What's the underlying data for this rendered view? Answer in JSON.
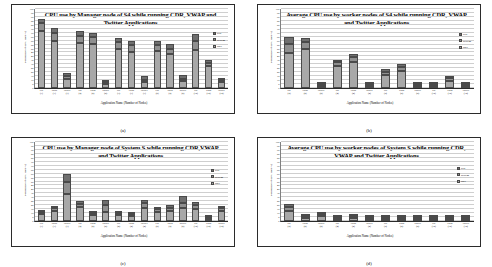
{
  "figure": {
    "panel_letters": [
      "(a)",
      "(b)",
      "(c)",
      "(d)"
    ],
    "axis_titles": {
      "x": "Application Name (Number of Nodes)",
      "y": "Percentage of CPU use (%)"
    },
    "legend": [
      {
        "label": "real",
        "color": "#6f6f6f"
      },
      {
        "label": "system",
        "color": "#8f8f8f"
      },
      {
        "label": "user",
        "color": "#a8a8a8"
      }
    ],
    "yticks": [
      0,
      5,
      10,
      15,
      20,
      25,
      30,
      35,
      40,
      45,
      50,
      55,
      60,
      65,
      70,
      75,
      80,
      85,
      90,
      95,
      100
    ]
  },
  "chart_data": [
    {
      "type": "bar",
      "id": "a",
      "title": "CPU use by Manager node of S4 while running CDR, VWAP and Twitter Applications",
      "xlabel": "Application Name (Number of Nodes)",
      "ylabel": "Percentage of CPU use (%)",
      "ylim": [
        0,
        100
      ],
      "grid": true,
      "legend_position": "right",
      "stacked": true,
      "categories": [
        "cdr (1)",
        "vwap (1)",
        "twitter (1)",
        "cdr (2)",
        "vwap (2)",
        "twitter (2)",
        "cdr (3)",
        "vwap (3)",
        "twitter (3)",
        "cdr (8)",
        "vwap (8)",
        "twitter (8)",
        "cdr (12)",
        "vwap (12)",
        "twitter (12)"
      ],
      "series": [
        {
          "name": "user",
          "values": [
            72,
            60,
            12,
            57,
            56,
            5,
            50,
            46,
            8,
            47,
            43,
            9,
            48,
            28,
            9
          ]
        },
        {
          "name": "system",
          "values": [
            10,
            10,
            3,
            9,
            9,
            2,
            8,
            8,
            2,
            7,
            7,
            2,
            12,
            4,
            2
          ]
        },
        {
          "name": "real",
          "values": [
            5,
            6,
            4,
            6,
            5,
            3,
            5,
            5,
            5,
            6,
            6,
            5,
            9,
            3,
            2
          ]
        }
      ],
      "totals": [
        87,
        76,
        19,
        72,
        70,
        10,
        63,
        59,
        15,
        60,
        56,
        16,
        69,
        35,
        13
      ]
    },
    {
      "type": "bar",
      "id": "b",
      "title": "Average CPU use by worker nodes of S4 while running CDR, VWAP and Twitter Applications",
      "xlabel": "Application Name (Number of Nodes)",
      "ylabel": "Percentage of CPU use (%)",
      "ylim": [
        0,
        100
      ],
      "grid": true,
      "legend_position": "right",
      "stacked": true,
      "categories": [
        "cdr (2)",
        "vwap (2)",
        "twitter (2)",
        "cdr (4)",
        "vwap (4)",
        "twitter (4)",
        "cdr (8)",
        "vwap (8)",
        "twitter (8)",
        "cdr (12)",
        "vwap (12)",
        "twitter (12)"
      ],
      "series": [
        {
          "name": "user",
          "values": [
            44,
            50,
            2,
            28,
            33,
            3,
            16,
            21,
            2,
            4,
            10,
            4
          ]
        },
        {
          "name": "system",
          "values": [
            12,
            8,
            0.5,
            5,
            6,
            0.5,
            4,
            5,
            0.5,
            1,
            3,
            2
          ]
        },
        {
          "name": "real",
          "values": [
            9,
            5,
            0.5,
            3,
            4,
            0.5,
            4,
            5,
            0.5,
            1,
            2,
            2
          ]
        }
      ],
      "totals": [
        65,
        63,
        3,
        36,
        43,
        4,
        24,
        31,
        3,
        6,
        15,
        8
      ]
    },
    {
      "type": "bar",
      "id": "c",
      "title": "CPU use by Manager node of System S while running CDR,VWAP and Twitter Applications",
      "xlabel": "Application Name (Number of Nodes)",
      "ylabel": "Percentage of CPU use (%)",
      "ylim": [
        0,
        100
      ],
      "grid": true,
      "legend_position": "right",
      "stacked": true,
      "categories": [
        "cdr (1)",
        "vwap (1)",
        "twitter (1)",
        "cdr (2)",
        "vwap (2)",
        "twitter (2)",
        "cdr (4)",
        "vwap (4)",
        "twitter (4)",
        "cdr (8)",
        "vwap (8)",
        "twitter (8)",
        "cdr (12)",
        "vwap (12)",
        "twitter (12)"
      ],
      "series": [
        {
          "name": "user",
          "values": [
            11,
            13,
            34,
            18,
            9,
            12,
            7,
            7,
            17,
            11,
            13,
            17,
            15,
            4,
            13
          ]
        },
        {
          "name": "system",
          "values": [
            2,
            3,
            16,
            4,
            2,
            8,
            3,
            2,
            6,
            4,
            4,
            6,
            5,
            1,
            4
          ]
        },
        {
          "name": "real",
          "values": [
            1,
            3,
            9,
            3,
            2,
            7,
            3,
            2,
            4,
            3,
            3,
            9,
            4,
            1,
            2
          ]
        }
      ],
      "totals": [
        14,
        19,
        59,
        25,
        13,
        27,
        13,
        11,
        27,
        18,
        20,
        32,
        24,
        6,
        19
      ]
    },
    {
      "type": "bar",
      "id": "d",
      "title": "Average CPU use by worker nodes of System S while running CDR, VWAP and Twitter Applications",
      "xlabel": "Application Name (Number of Nodes)",
      "ylabel": "Percentage of CPU use (%)",
      "ylim": [
        0,
        100
      ],
      "grid": true,
      "legend_position": "right",
      "stacked": true,
      "categories": [
        "cdr (2)",
        "vwap (2)",
        "twitter (2)",
        "cdr (4)",
        "vwap (4)",
        "twitter (4)",
        "cdr (8)",
        "vwap (8)",
        "twitter (8)",
        "cdr (12)",
        "vwap (12)",
        "twitter (12)"
      ],
      "series": [
        {
          "name": "user",
          "values": [
            13,
            6,
            7,
            5,
            6,
            5,
            3,
            3,
            2,
            3,
            2,
            2
          ]
        },
        {
          "name": "system",
          "values": [
            5,
            2,
            2,
            1,
            2,
            1,
            1,
            1,
            1,
            1,
            1,
            1
          ]
        },
        {
          "name": "real",
          "values": [
            4,
            1,
            2,
            1,
            1,
            1,
            1,
            1,
            0.5,
            1,
            0.5,
            0.5
          ]
        }
      ],
      "totals": [
        22,
        9,
        11,
        7,
        9,
        7,
        5,
        5,
        3.5,
        5,
        3.5,
        3.5
      ]
    }
  ]
}
